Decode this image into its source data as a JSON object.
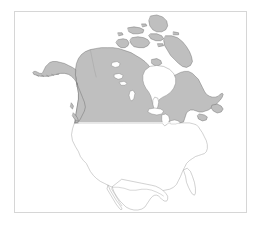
{
  "figure": {
    "title": "",
    "background_color": "#ffffff",
    "frame": {
      "visible": true,
      "color": "#d6d6d6",
      "x": 14,
      "y": 11,
      "width": 233,
      "height": 202
    }
  },
  "map": {
    "type": "choropleth-outline",
    "region": "North America",
    "projection_hint": "conic",
    "colors": {
      "highlight_fill": "#bfbfbf",
      "highlight_stroke": "#6a6a6a",
      "plain_fill": "#ffffff",
      "plain_stroke": "#9a9a9a",
      "water_fill": "#ffffff",
      "background": "#ffffff"
    },
    "legend": {
      "visible": false,
      "entries": []
    },
    "axes": {
      "visible": false,
      "x_ticks": [],
      "y_ticks": []
    },
    "annotations": [],
    "features": [
      {
        "name": "Canada",
        "label": "Canada",
        "state": "highlighted",
        "fill": "#bfbfbf"
      },
      {
        "name": "Alaska",
        "label": "Alaska",
        "state": "highlighted",
        "fill": "#bfbfbf"
      },
      {
        "name": "Canadian Arctic Archipelago",
        "label": "Arctic Islands",
        "state": "highlighted",
        "fill": "#bfbfbf"
      },
      {
        "name": "Baffin Island",
        "label": "Baffin Island",
        "state": "highlighted",
        "fill": "#bfbfbf"
      },
      {
        "name": "Newfoundland",
        "label": "Newfoundland",
        "state": "highlighted",
        "fill": "#bfbfbf"
      },
      {
        "name": "United States",
        "label": "United States",
        "state": "outline-only",
        "fill": "#ffffff"
      },
      {
        "name": "Mexico",
        "label": "Mexico",
        "state": "outline-only",
        "fill": "#ffffff"
      },
      {
        "name": "Hudson Bay",
        "label": "Hudson Bay",
        "state": "water",
        "fill": "#ffffff"
      },
      {
        "name": "Great Lakes",
        "label": "Great Lakes",
        "state": "water",
        "fill": "#ffffff"
      }
    ]
  },
  "chart_data": {
    "type": "map",
    "title": "",
    "xlabel": "",
    "ylabel": "",
    "categories": [
      "Canada",
      "Alaska",
      "United States",
      "Mexico"
    ],
    "values": [
      1,
      1,
      0,
      0
    ],
    "value_meaning": "1 = shaded/highlighted region, 0 = unshaded outline only",
    "grid": false,
    "legend_position": "none"
  }
}
